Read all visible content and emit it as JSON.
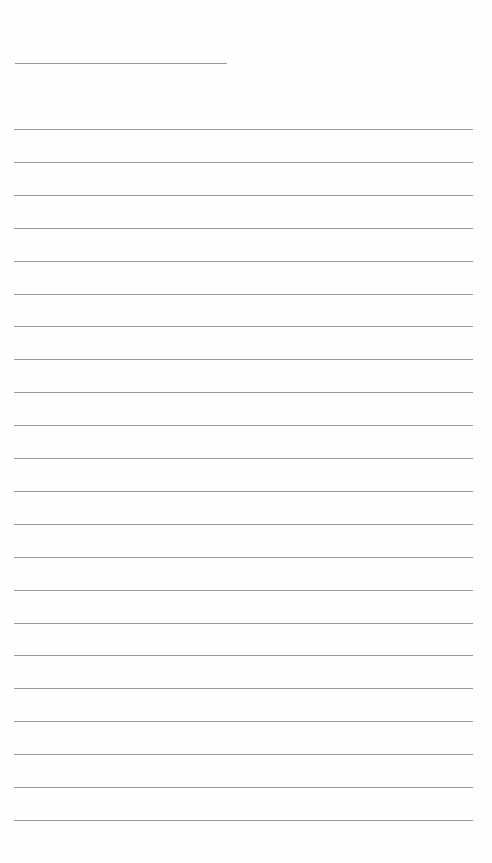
{
  "page": {
    "type": "blank-lined-paper",
    "title_line": {
      "present": true,
      "text": ""
    },
    "lines": {
      "count": 22,
      "first_y": 129,
      "spacing": 32.9,
      "texts": [
        "",
        "",
        "",
        "",
        "",
        "",
        "",
        "",
        "",
        "",
        "",
        "",
        "",
        "",
        "",
        "",
        "",
        "",
        "",
        "",
        "",
        ""
      ]
    },
    "colors": {
      "background": "#fefefe",
      "rule": "#8a8a8a"
    }
  }
}
